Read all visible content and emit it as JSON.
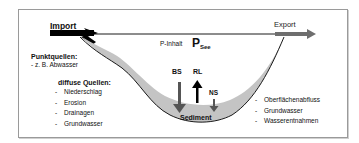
{
  "diagram": {
    "title": "P-Inhalt",
    "lake_symbol": "P",
    "lake_symbol_sub": "See",
    "import_label": "Import",
    "export_label": "Export",
    "point_sources": {
      "heading": "Punktquellen:",
      "items": [
        "- z. B. Abwasser"
      ]
    },
    "diffuse_sources": {
      "heading": "diffuse Quellen:",
      "items": [
        "Niederschlag",
        "Erosion",
        "Drainagen",
        "Grundwasser"
      ]
    },
    "outputs": {
      "items": [
        "Oberflächenabfluss",
        "Grundwasser",
        "Wasserentnahmen"
      ]
    },
    "fluxes": {
      "bs": "BS",
      "rl": "RL",
      "ns": "NS"
    },
    "sediment_label": "Sediment",
    "list_bullet": "-",
    "colors": {
      "frame": "#9a9a9a",
      "import_arrow": "#000000",
      "export_arrow": "#6e6e6e",
      "sediment_fill": "#c4c4c4",
      "lake_outline": "#1a1a1a",
      "text": "#111111"
    }
  }
}
